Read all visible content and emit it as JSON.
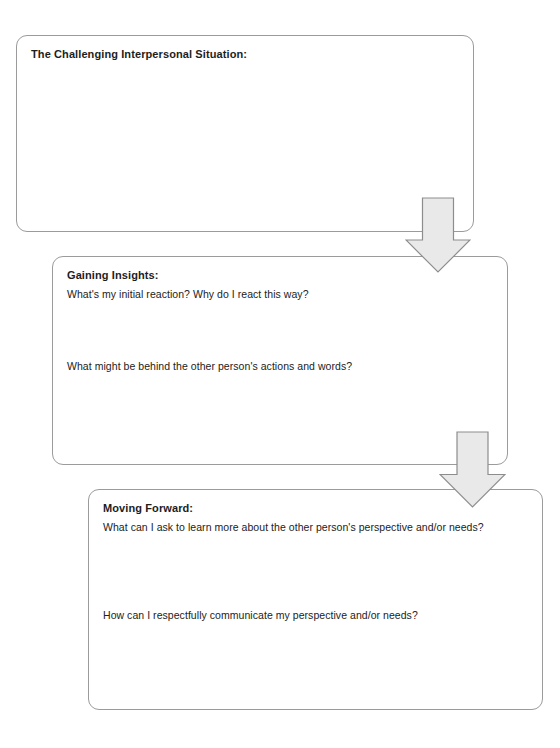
{
  "worksheet": {
    "background_color": "#ffffff",
    "box_border_color": "#9b9b9b",
    "arrow_fill_color": "#e9e9e9",
    "arrow_stroke_color": "#8d8d8d",
    "text_color": "#1d1d1d"
  },
  "boxes": [
    {
      "id": "situation",
      "title": "The Challenging Interpersonal Situation:",
      "questions": []
    },
    {
      "id": "insights",
      "title": "Gaining Insights:",
      "questions": [
        "What's my initial reaction? Why do I react this way?",
        "What might be behind the other person's actions and words?"
      ]
    },
    {
      "id": "forward",
      "title": "Moving Forward:",
      "questions": [
        "What can I ask to learn more about the other person's perspective and/or needs?",
        "How can I respectfully communicate my perspective and/or needs?"
      ]
    }
  ],
  "arrows": [
    {
      "id": "arrow-one",
      "icon": "down-arrow-icon"
    },
    {
      "id": "arrow-two",
      "icon": "down-arrow-icon"
    }
  ]
}
